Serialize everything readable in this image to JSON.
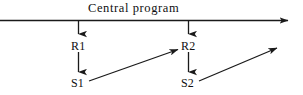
{
  "diagram": {
    "title": "Central  program",
    "background_color": "#ffffff",
    "stroke_color": "#1a1a1a",
    "nodes": [
      {
        "id": "r1",
        "label": "R1",
        "x": 71,
        "y": 40
      },
      {
        "id": "r2",
        "label": "R2",
        "x": 181,
        "y": 40
      },
      {
        "id": "s1",
        "label": "S1",
        "x": 71,
        "y": 77
      },
      {
        "id": "s2",
        "label": "S2",
        "x": 181,
        "y": 77
      }
    ],
    "edges": [
      {
        "id": "central-axis",
        "from": "left-edge",
        "to": "right-edge",
        "kind": "horizontal-arrow"
      },
      {
        "id": "axis-to-r1",
        "from": "central-axis",
        "to": "r1",
        "kind": "vertical-arrow"
      },
      {
        "id": "axis-to-r2",
        "from": "central-axis",
        "to": "r2",
        "kind": "vertical-arrow"
      },
      {
        "id": "r1-to-s1",
        "from": "r1",
        "to": "s1",
        "kind": "vertical-arrow"
      },
      {
        "id": "r2-to-s2",
        "from": "r2",
        "to": "s2",
        "kind": "vertical-arrow"
      },
      {
        "id": "s1-to-r2",
        "from": "s1",
        "to": "r2",
        "kind": "diagonal-arrow"
      },
      {
        "id": "s2-to-next",
        "from": "s2",
        "to": "off-right",
        "kind": "diagonal-arrow"
      }
    ]
  }
}
